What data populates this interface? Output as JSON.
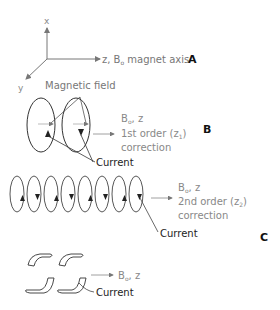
{
  "axes": {
    "x_label": "x",
    "y_label": "y",
    "z_label": "z, B",
    "z_sub": "o",
    "z_suffix": " magnet axis",
    "panel": "A"
  },
  "panel_b": {
    "field_label": "Magnetic field",
    "bo_label": "B",
    "bo_sub": "o",
    "bo_suffix": ", z",
    "order_prefix": "1st order (z",
    "order_sub": "1",
    "order_suffix": ")",
    "correction": "correction",
    "current": "Current",
    "panel": "B"
  },
  "panel_c": {
    "bo_label": "B",
    "bo_sub": "o",
    "bo_suffix": ", z",
    "order_prefix": "2nd order (z",
    "order_sub": "2",
    "order_suffix": ")",
    "correction": "correction",
    "current": "Current",
    "panel": "C"
  },
  "panel_d": {
    "bo_label": "B",
    "bo_sub": "o",
    "bo_suffix": ", z",
    "current": "Current"
  },
  "colors": {
    "line": "#555555",
    "text_gray": "#8a8a8a",
    "text_dark": "#2a2a2a",
    "panel_letter": "#111111"
  }
}
